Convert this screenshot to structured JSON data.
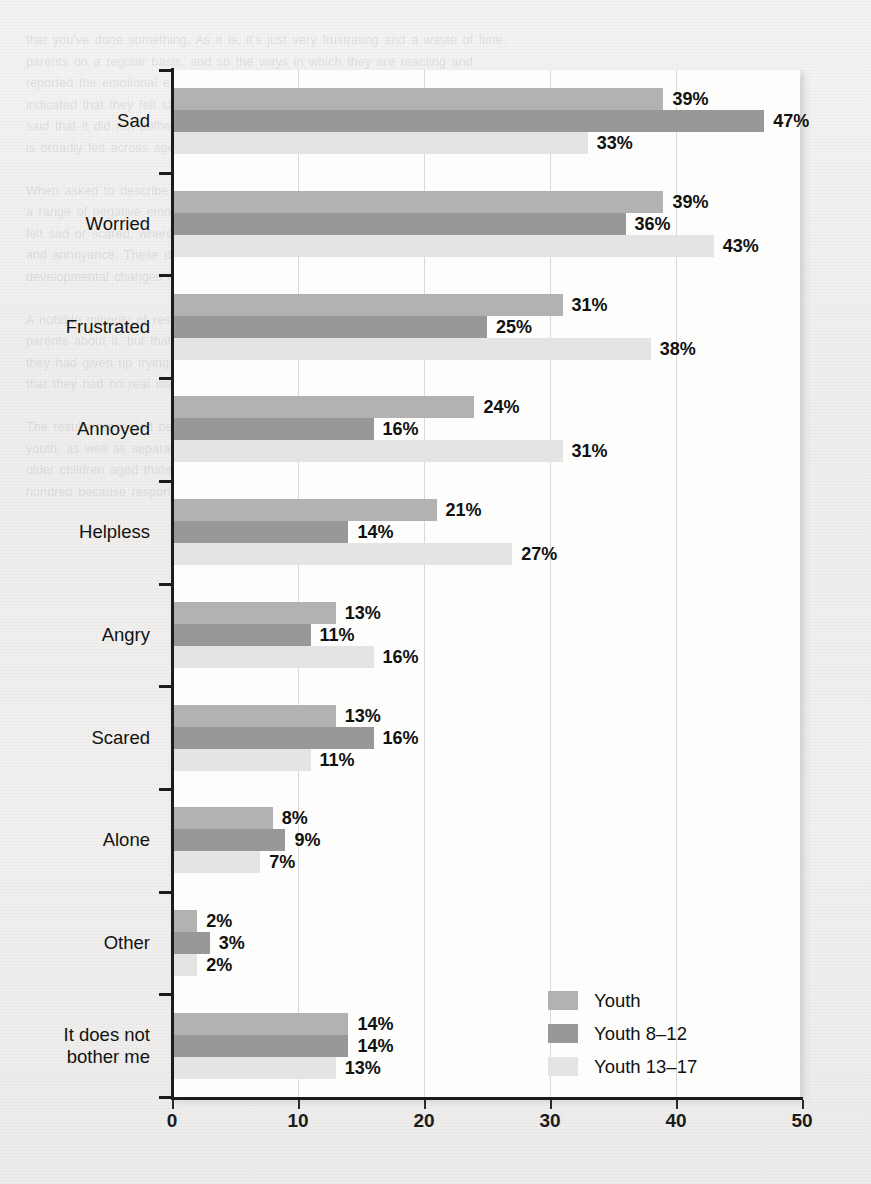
{
  "page": {
    "ghost_text": "that you've done something. As it is, it's just very frustrating and a waste of time.\nparents on a regular basis, and so the ways in which they are reacting and\nreported the emotional effects. Of those who responded, the vast majority\nindicated that they felt sad, worried, or frustrated. Only a small share\nsaid that it did not bother them at all, which suggests that the experience\nis broadly felt across age groups and settings.\n\nWhen asked to describe how it made them feel, children of all ages reported\na range of negative emotions. Younger children were more likely to say they\nfelt sad or scared, whereas older children more often reported frustration\nand annoyance. These differences are consistent with prior research on\ndevelopmental changes in emotional expression and coping strategies.\n\nA notable minority of respondents said that they had tried to talk to their\nparents about it, but that the conversation had not gone well. Others said\nthey had given up trying. Several described a sense of helplessness, noting\nthat they had no real way to change the behaviour of the adults around them.\n\nThe results presented below summarise the responses for the full sample of\nyouth, as well as separately for younger children aged eight to twelve and\nolder children aged thirteen to seventeen. Percentages sum to more than one\nhundred because respondents could select more than one option."
  },
  "chart_data": {
    "type": "bar",
    "orientation": "horizontal",
    "grouped": true,
    "title": "",
    "xlabel": "",
    "ylabel": "",
    "xlim": [
      0,
      50
    ],
    "xticks": [
      0,
      10,
      20,
      30,
      40,
      50
    ],
    "xtick_labels": [
      "0",
      "10",
      "20",
      "30",
      "40",
      "50"
    ],
    "grid": true,
    "grid_axis": "x",
    "value_suffix": "%",
    "legend_position": "inside-bottom-right",
    "categories": [
      "Sad",
      "Worried",
      "Frustrated",
      "Annoyed",
      "Helpless",
      "Angry",
      "Scared",
      "Alone",
      "Other",
      "It does not bother me"
    ],
    "series": [
      {
        "name": "Youth",
        "color": "#b2b2b2",
        "values": [
          39,
          39,
          31,
          24,
          21,
          13,
          13,
          8,
          2,
          14
        ],
        "labels": [
          "39%",
          "39%",
          "31%",
          "24%",
          "21%",
          "13%",
          "13%",
          "8%",
          "2%",
          "14%"
        ]
      },
      {
        "name": "Youth 8–12",
        "color": "#989898",
        "values": [
          47,
          36,
          25,
          16,
          14,
          11,
          16,
          9,
          3,
          14
        ],
        "labels": [
          "47%",
          "36%",
          "25%",
          "16%",
          "14%",
          "11%",
          "16%",
          "9%",
          "3%",
          "14%"
        ]
      },
      {
        "name": "Youth 13–17",
        "color": "#e4e4e4",
        "values": [
          33,
          43,
          38,
          31,
          27,
          16,
          11,
          7,
          2,
          13
        ],
        "labels": [
          "33%",
          "43%",
          "38%",
          "31%",
          "27%",
          "16%",
          "11%",
          "7%",
          "2%",
          "13%"
        ]
      }
    ]
  }
}
